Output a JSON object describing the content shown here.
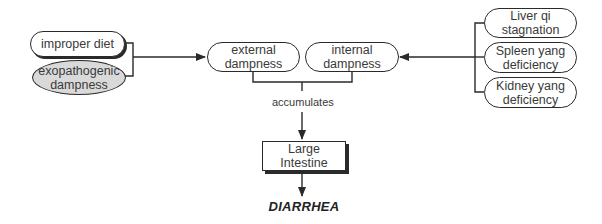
{
  "diagram": {
    "left_causes": [
      {
        "id": "improper-diet",
        "label": "improper diet",
        "shape": "pill"
      },
      {
        "id": "exopathogenic-dampness",
        "label": "exopathogenic dampness",
        "shape": "ellipse",
        "fill": "#d9d9d9"
      }
    ],
    "center_nodes": [
      {
        "id": "external-dampness",
        "label": "external dampness"
      },
      {
        "id": "internal-dampness",
        "label": "internal dampness"
      }
    ],
    "right_causes": [
      {
        "id": "liver-qi-stagnation",
        "label": "Liver qi stagnation"
      },
      {
        "id": "spleen-yang-deficiency",
        "label": "Spleen yang deficiency"
      },
      {
        "id": "kidney-yang-deficiency",
        "label": "Kidney yang deficiency"
      }
    ],
    "edge_label": "accumulates",
    "organ": "Large Intestine",
    "outcome": "DIARRHEA",
    "edges": [
      {
        "from": [
          "improper-diet",
          "exopathogenic-dampness"
        ],
        "to": "external-dampness"
      },
      {
        "from": [
          "liver-qi-stagnation",
          "spleen-yang-deficiency",
          "kidney-yang-deficiency"
        ],
        "to": "internal-dampness"
      },
      {
        "from": [
          "external-dampness",
          "internal-dampness"
        ],
        "to": "large-intestine",
        "label": "accumulates"
      },
      {
        "from": [
          "large-intestine"
        ],
        "to": "diarrhea"
      }
    ]
  }
}
